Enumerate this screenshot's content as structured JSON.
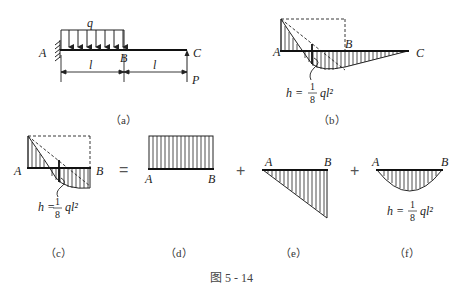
{
  "figure": {
    "caption": "图 5 - 14",
    "panels": {
      "a": {
        "caption": "（a）",
        "load_label": "q",
        "support_label": "A",
        "mid_label": "B",
        "end_label": "C",
        "force_label": "P",
        "span1_label": "l",
        "span2_label": "l"
      },
      "b": {
        "caption": "（b）",
        "left_label": "A",
        "mid_label": "B",
        "end_label": "C",
        "h_label": "h =",
        "frac_num": "1",
        "frac_den": "8",
        "frac_tail": "ql²"
      },
      "c": {
        "caption": "（c）",
        "left_label": "A",
        "right_label": "B",
        "h_label": "h =",
        "frac_num": "1",
        "frac_den": "8",
        "frac_tail": "ql²"
      },
      "d": {
        "caption": "（d）",
        "left_label": "A",
        "right_label": "B"
      },
      "e": {
        "caption": "（e）",
        "left_label": "A",
        "right_label": "B"
      },
      "f": {
        "caption": "（f）",
        "left_label": "A",
        "right_label": "B",
        "h_label": "h =",
        "frac_num": "1",
        "frac_den": "8",
        "frac_tail": "ql²"
      }
    },
    "operators": {
      "equals": "=",
      "plus1": "+",
      "plus2": "+"
    }
  }
}
